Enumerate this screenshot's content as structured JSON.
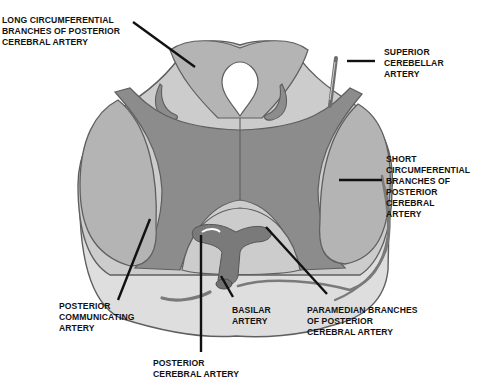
{
  "colors": {
    "background": "#ffffff",
    "outline": "#5f5f5f",
    "peduncle_lateral": "#b4b4b4",
    "central_dark": "#8c8c8c",
    "tegmentum_light": "#cccccc",
    "outer_rim": "#dedede",
    "aqueduct": "#ffffff",
    "artery": "#7a7a7a",
    "leader_line": "#111111"
  },
  "labels": {
    "long_circumferential": "LONG CIRCUMFERENTIAL\nBRANCHES OF POSTERIOR\nCEREBRAL ARTERY",
    "superior_cerebellar": "SUPERIOR\nCEREBELLAR\nARTERY",
    "short_circumferential": "SHORT\nCIRCUMFERENTIAL\nBRANCHES OF\nPOSTERIOR\nCEREBRAL\nARTERY",
    "posterior_communicating": "POSTERIOR\nCOMMUNICATING\nARTERY",
    "basilar": "BASILAR\nARTERY",
    "paramedian": "PARAMEDIAN BRANCHES\nOF POSTERIOR\nCEREBRAL ARTERY",
    "posterior_cerebral": "POSTERIOR\nCEREBRAL ARTERY"
  }
}
